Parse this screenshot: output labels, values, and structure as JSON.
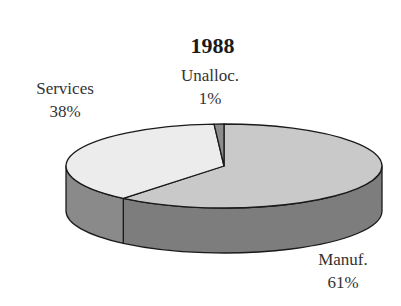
{
  "chart_data": {
    "type": "pie",
    "style": "3d",
    "title": "1988",
    "categories": [
      "Manuf.",
      "Services",
      "Unalloc."
    ],
    "values": [
      61,
      38,
      1
    ],
    "unit": "%",
    "slices": [
      {
        "label": "Manuf.",
        "value": 61,
        "pct_label": "61%",
        "top_color": "#c9c9c9",
        "side_color": "#7d7d7d"
      },
      {
        "label": "Services",
        "value": 38,
        "pct_label": "38%",
        "top_color": "#ececec",
        "side_color": "#8a8a8a"
      },
      {
        "label": "Unalloc.",
        "value": 1,
        "pct_label": "1%",
        "top_color": "#8c8c8c",
        "side_color": "#6e6e6e"
      }
    ],
    "start_angle_deg": -90,
    "direction": "clockwise",
    "legend": "none (labels placed next to slices)"
  },
  "geometry": {
    "cx": 224,
    "cy": 166,
    "rx": 158,
    "ry": 42,
    "depth": 45
  },
  "labels": {
    "title": "1988",
    "manuf_name": "Manuf.",
    "manuf_pct": "61%",
    "services_name": "Services",
    "services_pct": "38%",
    "unalloc_name": "Unalloc.",
    "unalloc_pct": "1%"
  }
}
